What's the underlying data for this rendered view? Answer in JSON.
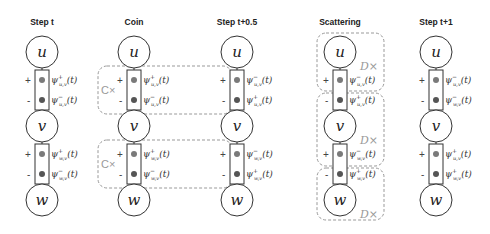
{
  "diagram": {
    "columns": [
      {
        "title": "Step t",
        "x": 42,
        "nodes": [
          "u",
          "v",
          "w"
        ],
        "edges": [
          {
            "plus_label": {
              "sup": "+",
              "sub": "u,v"
            },
            "minus_label": {
              "sup": "−",
              "sub": "u,v"
            }
          },
          {
            "plus_label": {
              "sup": "+",
              "sub": "w,v"
            },
            "minus_label": {
              "sup": "−",
              "sub": "w,v"
            }
          }
        ],
        "operators": []
      },
      {
        "title": "Coin",
        "x": 134,
        "nodes": [
          "u",
          "v",
          "w"
        ],
        "edges": [
          {
            "plus_label": {
              "sup": "+",
              "sub": "u,v"
            },
            "minus_label": {
              "sup": "−",
              "sub": "u,v"
            }
          },
          {
            "plus_label": {
              "sup": "+",
              "sub": "w,v"
            },
            "minus_label": {
              "sup": "−",
              "sub": "w,v"
            }
          }
        ],
        "operators": [
          {
            "label": "C×",
            "target": "edge u-v"
          },
          {
            "label": "C×",
            "target": "edge v-w"
          }
        ]
      },
      {
        "title": "Step t+0.5",
        "x": 237,
        "nodes": [
          "u",
          "v",
          "w"
        ],
        "edges": [
          {
            "plus_label": {
              "sup": "−",
              "sub": "u,v"
            },
            "minus_label": {
              "sup": "+",
              "sub": "u,v"
            }
          },
          {
            "plus_label": {
              "sup": "−",
              "sub": "w,v"
            },
            "minus_label": {
              "sup": "+",
              "sub": "w,v"
            }
          }
        ],
        "operators": []
      },
      {
        "title": "Scattering",
        "x": 340,
        "nodes": [
          "u",
          "v",
          "w"
        ],
        "edges": [
          {
            "plus_label": {
              "sup": "−",
              "sub": "u,v"
            },
            "minus_label": {
              "sup": "+",
              "sub": "u,v"
            }
          },
          {
            "plus_label": {
              "sup": "−",
              "sub": "w,v"
            },
            "minus_label": {
              "sup": "+",
              "sub": "w,v"
            }
          }
        ],
        "operators": [
          {
            "label": "D×",
            "target": "node u"
          },
          {
            "label": "D×",
            "target": "node v"
          },
          {
            "label": "D×",
            "target": "node w"
          }
        ]
      },
      {
        "title": "Step t+1",
        "x": 436,
        "nodes": [
          "u",
          "v",
          "w"
        ],
        "edges": [
          {
            "plus_label": {
              "sup": "−",
              "sub": "u,v"
            },
            "minus_label": {
              "sup": "−",
              "sub": "w,v"
            }
          },
          {
            "plus_label": {
              "sup": "+",
              "sub": "u,v"
            },
            "minus_label": {
              "sup": "+",
              "sub": "w,v"
            }
          }
        ],
        "operators": []
      }
    ],
    "port_signs": {
      "plus": "+",
      "minus": "-"
    },
    "psi_symbol": "ψ",
    "time_arg": "(t)",
    "colors": {
      "stroke": "#333333",
      "dashed": "#999999",
      "dot_top": "#7a7a7a",
      "dot_bottom": "#555555"
    }
  }
}
